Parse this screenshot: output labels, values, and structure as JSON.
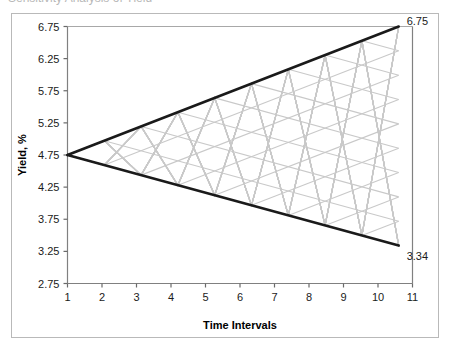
{
  "top_fragment": {
    "text": "Sensitivity Analysis of Yield"
  },
  "chart_data": {
    "type": "line",
    "title": "",
    "xlabel": "Time Intervals",
    "ylabel": "Yield, %",
    "xlim": [
      1,
      11
    ],
    "ylim": [
      2.75,
      6.75
    ],
    "xticks": [
      1,
      2,
      3,
      4,
      5,
      6,
      7,
      8,
      9,
      10,
      11
    ],
    "xtick_labels": [
      "1",
      "2",
      "3",
      "4",
      "5",
      "6",
      "7",
      "8",
      "9",
      "10",
      "11"
    ],
    "yticks": [
      2.75,
      3.25,
      3.75,
      4.25,
      4.75,
      5.25,
      5.75,
      6.25,
      6.75
    ],
    "ytick_labels": [
      "2.75",
      "3.25",
      "3.75",
      "4.25",
      "4.75",
      "5.25",
      "5.75",
      "6.25",
      "6.75"
    ],
    "grid": false,
    "legend": "none",
    "x_start": 1,
    "x_end": 10.6,
    "y_origin": 4.75,
    "series": [
      {
        "name": "upper-bound",
        "color": "#1a1a1a",
        "width": 2.6,
        "x": [
          1,
          10.6
        ],
        "values": [
          4.75,
          6.75
        ]
      },
      {
        "name": "lower-bound",
        "color": "#1a1a1a",
        "width": 2.6,
        "x": [
          1,
          10.6
        ],
        "values": [
          4.75,
          3.34
        ]
      }
    ],
    "annotations": [
      {
        "name": "upper-end-label",
        "text": "6.75",
        "x": 10.6,
        "y": 6.75
      },
      {
        "name": "lower-end-label",
        "text": "3.34",
        "x": 10.6,
        "y": 3.34
      }
    ],
    "lattice": {
      "name": "scenario-fan-lattice",
      "color": "#c9c9c9",
      "width": 1.1,
      "segments": 9,
      "upper_envelope": [
        4.75,
        6.75
      ],
      "lower_envelope": [
        4.75,
        3.34
      ],
      "description": "zig-zag diamond lattice of light gray paths between the two black envelope lines"
    }
  }
}
